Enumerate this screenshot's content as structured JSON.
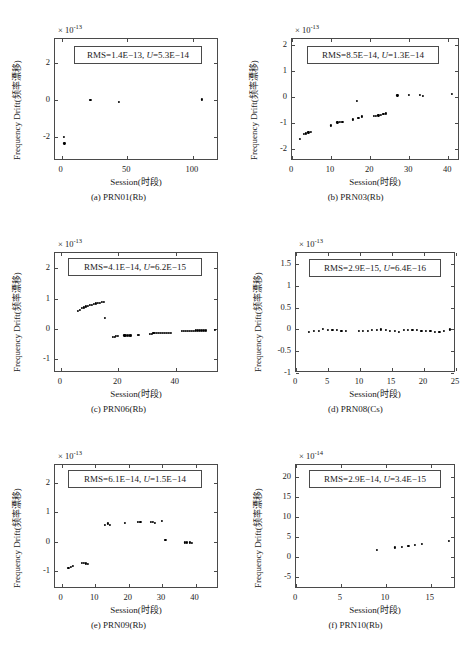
{
  "figure": {
    "axis_labels": {
      "y": "Frequency Drift(频率漂移)",
      "x": "Session(时段)"
    }
  },
  "chart_data": [
    {
      "id": "a",
      "type": "scatter",
      "caption": "(a) PRN01(Rb)",
      "title": "",
      "xlabel": "Session(时段)",
      "ylabel": "Frequency Drift(频率漂移)",
      "exponent": "× 10",
      "exponent_sup": "-13",
      "annotation": "RMS=1.4E−13, U=5.3E−14",
      "annotation_rms": "RMS=1.4E−13,",
      "annotation_u_var": "U",
      "annotation_u_val": "=5.3E−14",
      "xlim": [
        -5,
        120
      ],
      "ylim": [
        -3.3,
        3.3
      ],
      "xticks": [
        0,
        50,
        100
      ],
      "xticklabels": [
        "0",
        "50",
        "100"
      ],
      "yticks": [
        -2,
        0,
        2
      ],
      "yticklabels": [
        "-2",
        "0",
        "2"
      ],
      "grid": false,
      "x": [
        1.5,
        2.2,
        22,
        44,
        107
      ],
      "y": [
        -2.0,
        -2.35,
        0.02,
        -0.12,
        0.03
      ]
    },
    {
      "id": "b",
      "type": "scatter",
      "caption": "(b) PRN03(Rb)",
      "title": "",
      "xlabel": "Session(时段)",
      "ylabel": "Frequency Drift(频率漂移)",
      "exponent": "× 10",
      "exponent_sup": "-13",
      "annotation": "RMS=8.5E−14, U=1.3E−14",
      "annotation_rms": "RMS=8.5E−14,",
      "annotation_u_var": "U",
      "annotation_u_val": "=1.3E−14",
      "xlim": [
        0,
        43
      ],
      "ylim": [
        -2.45,
        2.25
      ],
      "xticks": [
        0,
        10,
        20,
        30,
        40
      ],
      "xticklabels": [
        "0",
        "10",
        "20",
        "30",
        "40"
      ],
      "yticks": [
        -2,
        -1,
        0,
        1,
        2
      ],
      "yticklabels": [
        "-2",
        "-1",
        "0",
        "1",
        "2"
      ],
      "grid": false,
      "x": [
        2,
        3,
        3.6,
        4.2,
        4.8,
        10,
        11.6,
        12.3,
        12.9,
        15.6,
        16.6,
        17,
        17.9,
        20.9,
        21.5,
        22.1,
        22.8,
        23.4,
        24,
        27,
        30,
        32.8,
        33.6,
        41
      ],
      "y": [
        -1.6,
        -1.42,
        -1.39,
        -1.35,
        -1.32,
        -1.08,
        -0.96,
        -0.93,
        -0.93,
        -0.85,
        -0.15,
        -0.78,
        -0.73,
        -0.7,
        -0.7,
        -0.69,
        -0.67,
        -0.65,
        -0.62,
        0.08,
        0.1,
        0.1,
        0.07,
        0.13
      ]
    },
    {
      "id": "c",
      "type": "scatter",
      "caption": "(c) PRN06(Rb)",
      "title": "",
      "xlabel": "Session(时段)",
      "ylabel": "Frequency Drift(频率漂移)",
      "exponent": "× 10",
      "exponent_sup": "-13",
      "annotation": "RMS=4.1E−14, U=6.2E−15",
      "annotation_rms": "RMS=4.1E−14,",
      "annotation_u_var": "U",
      "annotation_u_val": "=6.2E−15",
      "xlim": [
        -2,
        55
      ],
      "ylim": [
        -1.45,
        2.5
      ],
      "xticks": [
        0,
        20,
        40
      ],
      "xticklabels": [
        "0",
        "20",
        "40"
      ],
      "yticks": [
        -1,
        0,
        1,
        2
      ],
      "yticklabels": [
        "-1",
        "0",
        "1",
        "2"
      ],
      "grid": false,
      "x": [
        6,
        6.7,
        7.4,
        8.1,
        8.8,
        9.5,
        10.2,
        10.9,
        11.6,
        12.3,
        13,
        13.7,
        14.4,
        15.1,
        15.4,
        18.2,
        18.8,
        19.3,
        19.8,
        22.1,
        22.7,
        23.3,
        23.9,
        24.5,
        26.7,
        27.3,
        30.9,
        31.6,
        32.2,
        32.8,
        33.5,
        34.2,
        34.9,
        35.6,
        36.3,
        37,
        37.7,
        38.4,
        42,
        42.7,
        43.4,
        44.1,
        44.8,
        45.5,
        46.2,
        46.9,
        47.6,
        48.3,
        49,
        49.7,
        50.4,
        53.5
      ],
      "y": [
        0.6,
        0.64,
        0.68,
        0.71,
        0.74,
        0.76,
        0.78,
        0.8,
        0.82,
        0.84,
        0.86,
        0.87,
        0.88,
        0.89,
        0.36,
        -0.26,
        -0.25,
        -0.24,
        -0.23,
        -0.21,
        -0.21,
        -0.21,
        -0.21,
        -0.21,
        -0.19,
        -0.19,
        -0.16,
        -0.15,
        -0.14,
        -0.14,
        -0.13,
        -0.13,
        -0.13,
        -0.12,
        -0.12,
        -0.12,
        -0.12,
        -0.12,
        -0.07,
        -0.07,
        -0.07,
        -0.06,
        -0.06,
        -0.06,
        -0.06,
        -0.05,
        -0.05,
        -0.05,
        -0.05,
        -0.05,
        -0.05,
        -0.04
      ]
    },
    {
      "id": "d",
      "type": "scatter",
      "caption": "(d) PRN08(Cs)",
      "title": "",
      "xlabel": "Session(时段)",
      "ylabel": "Frequency Drift(频率漂移)",
      "exponent": "× 10",
      "exponent_sup": "-13",
      "annotation": "RMS=2.9E−15, U=6.4E−16",
      "annotation_rms": "RMS=2.9E−15,",
      "annotation_u_var": "U",
      "annotation_u_val": "=6.4E−16",
      "xlim": [
        0,
        25
      ],
      "ylim": [
        -1.0,
        1.75
      ],
      "xticks": [
        0,
        5,
        10,
        15,
        20,
        25
      ],
      "xticklabels": [
        "0",
        "5",
        "10",
        "15",
        "20",
        "25"
      ],
      "yticks": [
        -1,
        -0.5,
        0,
        0.5,
        1,
        1.5
      ],
      "yticklabels": [
        "-1",
        "-0.5",
        "0",
        "0.5",
        "1",
        "1.5"
      ],
      "grid": false,
      "x": [
        2,
        2.8,
        3.6,
        4.2,
        5.0,
        5.7,
        6.4,
        7.1,
        7.8,
        9.8,
        10.5,
        11.2,
        11.9,
        12.6,
        13.3,
        14.0,
        14.7,
        15.4,
        16.1,
        16.8,
        17.5,
        18.2,
        18.9,
        19.6,
        20.3,
        21.0,
        21.7,
        22.4,
        23.1,
        24.0
      ],
      "y": [
        -0.05,
        -0.04,
        -0.03,
        0.01,
        -0.02,
        -0.02,
        -0.02,
        -0.03,
        -0.04,
        -0.03,
        -0.03,
        -0.03,
        -0.02,
        -0.02,
        0.0,
        -0.01,
        -0.03,
        -0.04,
        -0.05,
        -0.02,
        -0.02,
        -0.02,
        -0.02,
        -0.03,
        -0.03,
        -0.04,
        -0.05,
        -0.05,
        -0.04,
        0.0
      ]
    },
    {
      "id": "e",
      "type": "scatter",
      "caption": "(e) PRN09(Rb)",
      "title": "",
      "xlabel": "Session(时段)",
      "ylabel": "Frequency Drift(频率漂移)",
      "exponent": "× 10",
      "exponent_sup": "-13",
      "annotation": "RMS=6.1E−14, U=1.5E−14",
      "annotation_rms": "RMS=6.1E−14,",
      "annotation_u_var": "U",
      "annotation_u_val": "=1.5E−14",
      "xlim": [
        -2,
        47
      ],
      "ylim": [
        -1.6,
        2.6
      ],
      "xticks": [
        0,
        10,
        20,
        30,
        40
      ],
      "xticklabels": [
        "0",
        "10",
        "20",
        "30",
        "40"
      ],
      "yticks": [
        -1,
        0,
        1,
        2
      ],
      "yticklabels": [
        "-1",
        "0",
        "1",
        "2"
      ],
      "grid": false,
      "x": [
        2,
        2.7,
        3.4,
        6.0,
        6.6,
        7.2,
        7.8,
        13.0,
        13.8,
        14.3,
        18.9,
        22.7,
        23.5,
        26.6,
        27.2,
        27.9,
        30.0,
        31.0,
        36.8,
        37.5,
        38.2,
        39.0
      ],
      "y": [
        -0.88,
        -0.84,
        -0.82,
        -0.72,
        -0.71,
        -0.73,
        -0.74,
        0.57,
        0.62,
        0.58,
        0.63,
        0.68,
        0.68,
        0.66,
        0.68,
        0.65,
        0.71,
        0.05,
        -0.02,
        -0.02,
        -0.02,
        -0.03
      ]
    },
    {
      "id": "f",
      "type": "scatter",
      "caption": "(f) PRN10(Rb)",
      "title": "",
      "xlabel": "Session(时段)",
      "ylabel": "Frequency Drift(频率漂移)",
      "exponent": "× 10",
      "exponent_sup": "-14",
      "annotation": "RMS=2.9E−14, U=3.4E−15",
      "annotation_rms": "RMS=2.9E−14,",
      "annotation_u_var": "U",
      "annotation_u_val": "=3.4E−15",
      "xlim": [
        0,
        17.8
      ],
      "ylim": [
        -8,
        23
      ],
      "xticks": [
        0,
        5,
        10,
        15
      ],
      "xticklabels": [
        "0",
        "5",
        "10",
        "15"
      ],
      "yticks": [
        -5,
        0,
        5,
        10,
        15,
        20
      ],
      "yticklabels": [
        "-5",
        "0",
        "5",
        "10",
        "15",
        "20"
      ],
      "grid": false,
      "x": [
        9.0,
        11.0,
        11.8,
        12.5,
        13.2,
        14.0,
        17.0
      ],
      "y": [
        1.8,
        2.4,
        2.6,
        2.7,
        3.0,
        3.2,
        4.1
      ]
    }
  ]
}
